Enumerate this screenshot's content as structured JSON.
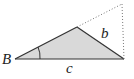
{
  "diagram": {
    "type": "triangle",
    "labels": {
      "vertex_b": "B",
      "side_b": "b",
      "side_c": "c"
    },
    "points": {
      "B": [
        15,
        59
      ],
      "apex": [
        77,
        27
      ],
      "right": [
        124,
        59
      ],
      "dotted_top": [
        122,
        4
      ]
    },
    "colors": {
      "fill": "#d9d9d9",
      "stroke": "#333333",
      "dotted": "#777777"
    }
  }
}
